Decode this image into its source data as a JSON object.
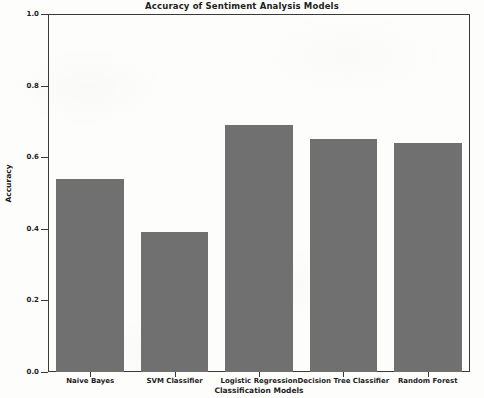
{
  "chart_data": {
    "type": "bar",
    "title": "Accuracy of Sentiment Analysis Models",
    "xlabel": "Classification Models",
    "ylabel": "Accuracy",
    "categories": [
      "Naive Bayes",
      "SVM Classifier",
      "Logistic Regression",
      "Decision Tree Classifier",
      "Random Forest"
    ],
    "values": [
      0.54,
      0.39,
      0.69,
      0.65,
      0.64
    ],
    "ylim": [
      0.0,
      1.0
    ],
    "xlim_note": "categorical",
    "yticks": [
      0.0,
      0.2,
      0.4,
      0.6,
      0.8,
      1.0
    ],
    "ytick_labels": [
      "0.0",
      "0.2",
      "0.4",
      "0.6",
      "0.8",
      "1.0"
    ],
    "grid": false,
    "legend": null,
    "bar_color": "#707070",
    "axis_color": "#3a3a3a",
    "background_color": "#fdfdfc",
    "series": [
      {
        "name": "Accuracy",
        "values": [
          0.54,
          0.39,
          0.69,
          0.65,
          0.64
        ]
      }
    ]
  }
}
